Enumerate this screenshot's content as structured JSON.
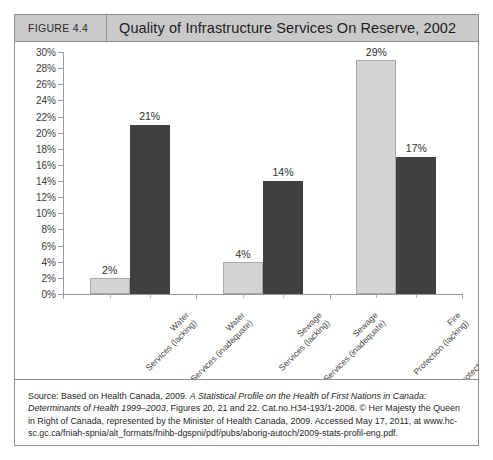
{
  "figure": {
    "number_label": "FIGURE 4.4",
    "title": "Quality of Infrastructure Services On Reserve, 2002"
  },
  "chart_data": {
    "type": "bar",
    "title": "Quality of Infrastructure Services On Reserve, 2002",
    "xlabel": "",
    "ylabel": "",
    "ylim": [
      0,
      30
    ],
    "ytick_labels": [
      "30%",
      "28%",
      "26%",
      "24%",
      "22%",
      "20%",
      "18%",
      "16%",
      "14%",
      "12%",
      "10%",
      "8%",
      "6%",
      "4%",
      "2%",
      "0%"
    ],
    "ytick_values": [
      30,
      28,
      26,
      24,
      22,
      20,
      18,
      16,
      14,
      12,
      10,
      8,
      6,
      4,
      2,
      0
    ],
    "grid": false,
    "legend": "none",
    "categories": [
      "Water Services (lacking)",
      "Water Services (inadequate)",
      "Sewage Services (lacking)",
      "Sewage Services (inadequate)",
      "Fire Protection (lacking)",
      "Fire Protection (inadequate)"
    ],
    "category_lines": [
      [
        "Water",
        "Services (lacking)"
      ],
      [
        "Water",
        "Services (inadequate)"
      ],
      [
        "Sewage",
        "Services (lacking)"
      ],
      [
        "Sewage",
        "Services (inadequate)"
      ],
      [
        "Fire",
        "Protection (lacking)"
      ],
      [
        "Fire",
        "Protection (inadequate)"
      ]
    ],
    "values": [
      2,
      21,
      4,
      14,
      29,
      17
    ],
    "data_labels": [
      "2%",
      "21%",
      "4%",
      "14%",
      "29%",
      "17%"
    ],
    "bar_colors": [
      "#d4d4d4",
      "#404040",
      "#d4d4d4",
      "#404040",
      "#d4d4d4",
      "#404040"
    ],
    "groups": [
      "Water",
      "Sewage",
      "Fire Protection"
    ]
  },
  "source": {
    "label": "Source:",
    "text_part_1": "Source: Based on Health Canada, 2009. ",
    "italic_1": "A Statistical Profile on the Health of First Nations in Canada: Determinants of Health 1999–2003",
    "text_part_2": ", Figures 20, 21 and 22. Cat.no.H34-193/1-2008. © Her Majesty the Queen in Right of Canada, represented by the Minister of Health Canada, 2009. Accessed May 17, 2011, at ",
    "url": "www.hc-sc.gc.ca/fniah-spnia/alt_formats/fnihb-dgspni/pdf/pubs/aborig-autoch/2009-stats-profil-eng.pdf."
  },
  "colors": {
    "header_background": "#c9c9c9",
    "border": "#8e8e8e",
    "bar_light": "#d4d4d4",
    "bar_dark": "#404040",
    "axis": "#9a9a9a"
  }
}
